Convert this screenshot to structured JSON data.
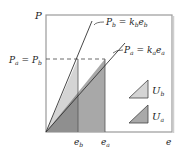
{
  "diagram": {
    "axes": {
      "y_label": "P",
      "x_label": "e"
    },
    "lines": [
      {
        "id": "b",
        "equation": "P_b = k_b e_b",
        "display_lhs": "P",
        "lhs_sub": "b",
        "rhs_k": "k",
        "rhs_k_sub": "b",
        "rhs_e": "e",
        "rhs_e_sub": "b"
      },
      {
        "id": "a",
        "equation": "P_a = k_a e_a",
        "display_lhs": "P",
        "lhs_sub": "a",
        "rhs_k": "k",
        "rhs_k_sub": "a",
        "rhs_e": "e",
        "rhs_e_sub": "a"
      }
    ],
    "level_label": {
      "text": "P_a = P_b",
      "p": "P",
      "sub_a": "a",
      "eq": "=",
      "sub_b": "b"
    },
    "x_ticks": [
      {
        "base": "e",
        "sub": "b"
      },
      {
        "base": "e",
        "sub": "a"
      }
    ],
    "legend": [
      {
        "symbol": "U",
        "sub": "b",
        "meaning": "strain energy b",
        "color": "#d4d4d4"
      },
      {
        "symbol": "U",
        "sub": "a",
        "meaning": "strain energy a",
        "color": "#a9a9a9"
      }
    ],
    "colors": {
      "frame": "#9a9a9a",
      "light_fill": "#d4d4d4",
      "dark_fill": "#a8a8a8",
      "overlap_fill": "#8f8f8f",
      "line": "#333333"
    }
  }
}
